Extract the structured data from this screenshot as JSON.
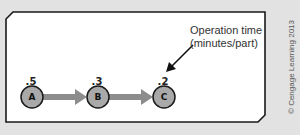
{
  "colors": {
    "background": "#e2e2e2",
    "frame_fill": "#ffffff",
    "frame_stroke": "#1a1a1a",
    "node_fill": "#a9a9a9",
    "node_stroke": "#1a1a1a",
    "arrow_fill": "#8c8c8c",
    "pointer_arrow": "#111111"
  },
  "nodes": [
    {
      "letter": "A",
      "time": ".5"
    },
    {
      "letter": "B",
      "time": ".3"
    },
    {
      "letter": "C",
      "time": ".2"
    }
  ],
  "annotation": {
    "line1": "Operation time",
    "line2": "(minutes/part)"
  },
  "copyright": "© Cengage Learning 2013"
}
